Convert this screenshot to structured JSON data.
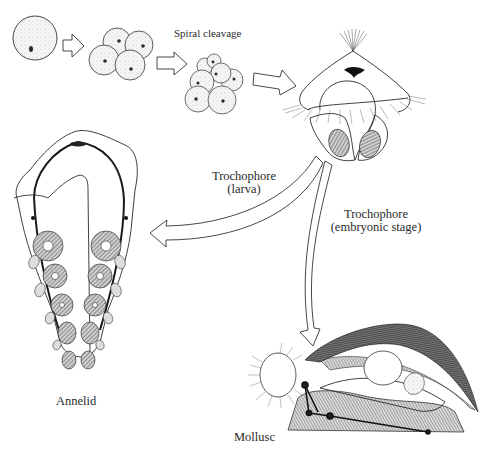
{
  "labels": {
    "spiral_cleavage": "Spiral cleavage",
    "trochophore_larva_line1": "Trochophore",
    "trochophore_larva_line2": "(larva)",
    "trochophore_embryo_line1": "Trochophore",
    "trochophore_embryo_line2": "(embryonic stage)",
    "annelid": "Annelid",
    "mollusc": "Mollusc"
  },
  "stages": [
    "egg",
    "4-cell stage",
    "8-cell spiral cleavage",
    "trochophore",
    "annelid",
    "mollusc"
  ],
  "colors": {
    "line": "#2a2a2a",
    "background": "#ffffff",
    "hatch": "#6a6a6a"
  }
}
